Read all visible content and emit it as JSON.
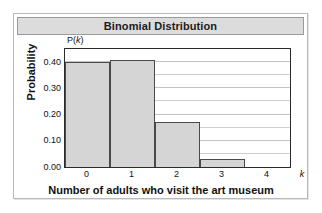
{
  "figure": {
    "title": "Binomial Distribution"
  },
  "chart_data": {
    "type": "bar",
    "title": "Binomial Distribution",
    "xlabel": "Number of adults who visit the art museum",
    "ylabel": "Probability",
    "y_axis_symbol": "P(k)",
    "x_axis_symbol": "k",
    "categories": [
      "0",
      "1",
      "2",
      "3",
      "4"
    ],
    "values": [
      0.4,
      0.41,
      0.17,
      0.03,
      0.0
    ],
    "ytick_labels": [
      "0.00",
      "0.10",
      "0.20",
      "0.30",
      "0.40"
    ],
    "ytick_values": [
      0.0,
      0.1,
      0.2,
      0.3,
      0.4
    ],
    "xtick_labels": [
      "0",
      "1",
      "2",
      "3",
      "4"
    ],
    "ylim": [
      0.0,
      0.45
    ],
    "xlim": [
      -0.5,
      4.5
    ],
    "grid": true,
    "gridline_interval": 0.05,
    "legend": "none",
    "bar_fill_color": "#d5d5d5",
    "bar_edge_color": "#4a4a4a",
    "gridline_color": "#cfcfcf",
    "frame_color": "#2b2b2b",
    "title_bar_color": "#dcdcdc"
  }
}
